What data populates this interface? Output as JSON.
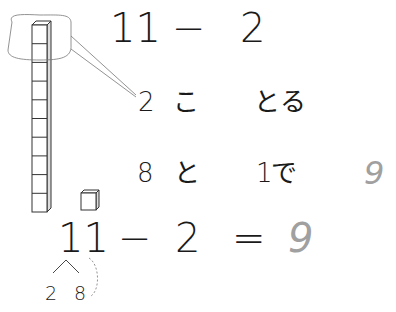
{
  "problem": {
    "top_equation": {
      "a": "11",
      "op": "−",
      "b": "2"
    },
    "step1": {
      "num": "2",
      "counter": "こ",
      "verb": "とる"
    },
    "step2": {
      "num1": "8",
      "particle": "と",
      "num2": "1",
      "suffix": "で",
      "answer": "9"
    },
    "bottom_equation": {
      "a": "11",
      "op": "−",
      "b": "2",
      "eq": "=",
      "answer": "9"
    },
    "decomposition": {
      "left": "2",
      "right": "8"
    }
  },
  "manipulatives": {
    "tower_cubes": 10,
    "single_cubes": 1,
    "circled_cubes": 2
  },
  "colors": {
    "ink": "#1a1a1a",
    "answer": "#a0a0a0",
    "line": "#333333"
  }
}
